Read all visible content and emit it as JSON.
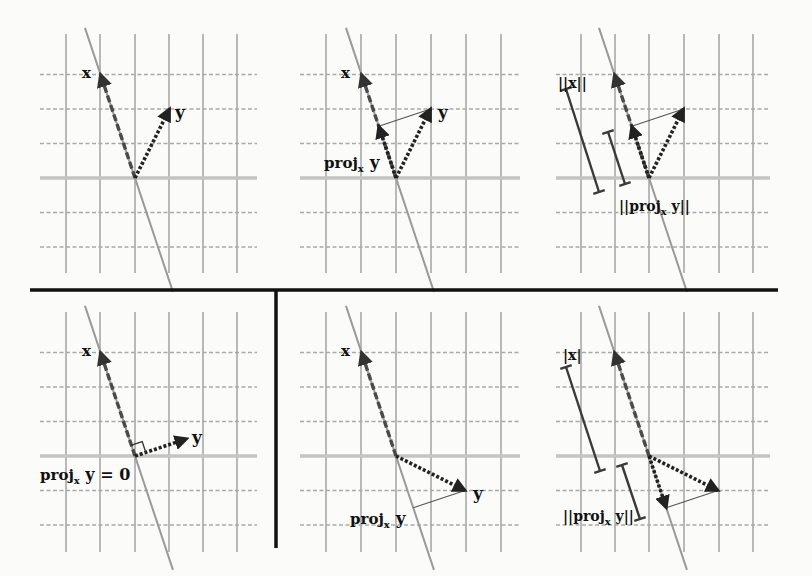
{
  "figure": {
    "grid_unit_px": 34.5,
    "line_direction": [
      -1,
      3
    ],
    "colors": {
      "background": "#fbfbfa",
      "grid": "#a9a9a9",
      "axis": "#c4c4c4",
      "span_line": "#9a9a9a",
      "vector_x": "#4a4a4a",
      "vector_y": "#222222",
      "divider": "#111111"
    },
    "panels": [
      {
        "id": "top-left",
        "labels": {
          "x": "x",
          "y": "y"
        },
        "vector_x": [
          -1,
          3
        ],
        "vector_y": [
          1,
          2
        ]
      },
      {
        "id": "top-center",
        "labels": {
          "x": "x",
          "y": "y",
          "proj_main": "proj",
          "proj_sub": "x",
          "proj_tail": " y"
        },
        "vector_x": [
          -1,
          3
        ],
        "vector_y": [
          1,
          2
        ],
        "projection": [
          -0.5,
          1.5
        ]
      },
      {
        "id": "top-right",
        "labels": {
          "norm_x": "||x||",
          "norm_proj_pre": "||proj",
          "norm_proj_sub": "x",
          "norm_proj_post": " y||"
        },
        "vector_x": [
          -1,
          3
        ],
        "vector_y": [
          1,
          2
        ],
        "projection": [
          -0.5,
          1.5
        ]
      },
      {
        "id": "bottom-left",
        "labels": {
          "x": "x",
          "y": "y",
          "proj_main": "proj",
          "proj_sub": "x",
          "proj_tail": " y = 0"
        },
        "vector_x": [
          -1,
          3
        ],
        "vector_y": [
          1.5,
          0.5
        ],
        "projection": [
          0,
          0
        ]
      },
      {
        "id": "bottom-center",
        "labels": {
          "x": "x",
          "y": "y",
          "proj_main": "proj",
          "proj_sub": "x",
          "proj_tail": " y"
        },
        "vector_x": [
          -1,
          3
        ],
        "vector_y": [
          2,
          -1
        ],
        "projection": [
          0.5,
          -1.5
        ]
      },
      {
        "id": "bottom-right",
        "labels": {
          "norm_x": "|x|",
          "norm_proj_pre": "||proj",
          "norm_proj_sub": "x",
          "norm_proj_post": " y||"
        },
        "vector_x": [
          -1,
          3
        ],
        "vector_y": [
          2,
          -1
        ],
        "projection": [
          0.5,
          -1.5
        ]
      }
    ]
  }
}
